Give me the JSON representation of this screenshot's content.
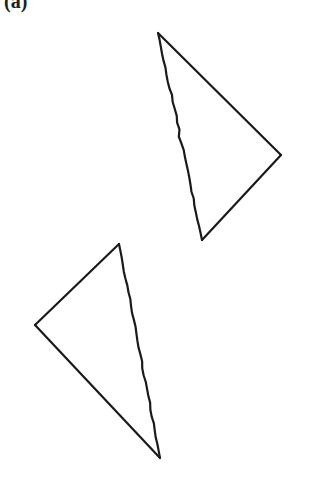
{
  "figure": {
    "panel_label": "(a)",
    "background_color": "#ffffff",
    "stroke_color": "#1a1a1a",
    "stroke_width": 2.2,
    "canvas": {
      "width": 328,
      "height": 486
    },
    "triangles": [
      {
        "name": "triangle-ABC",
        "vertices": [
          {
            "label": "A",
            "x": 119,
            "y": 244
          },
          {
            "label": "B",
            "x": 35,
            "y": 325
          },
          {
            "label": "C",
            "x": 160,
            "y": 458
          }
        ],
        "edges": [
          {
            "from": "B",
            "to": "A",
            "style": "straight"
          },
          {
            "from": "B",
            "to": "C",
            "style": "straight"
          },
          {
            "from": "A",
            "to": "C",
            "style": "wavy"
          }
        ]
      },
      {
        "name": "triangle-A-prime-B-prime-C-prime",
        "vertices": [
          {
            "label": "A′",
            "x": 202,
            "y": 240
          },
          {
            "label": "B′",
            "x": 281,
            "y": 155
          },
          {
            "label": "C′",
            "x": 158,
            "y": 33
          }
        ],
        "edges": [
          {
            "from": "C′",
            "to": "B′",
            "style": "straight"
          },
          {
            "from": "B′",
            "to": "A′",
            "style": "straight"
          },
          {
            "from": "C′",
            "to": "A′",
            "style": "wavy"
          }
        ]
      }
    ],
    "labels": [
      {
        "name": "label-A",
        "base": "A",
        "prime": "",
        "x": 112,
        "y": 212
      },
      {
        "name": "label-B",
        "base": "B",
        "prime": "",
        "x": 8,
        "y": 310
      },
      {
        "name": "label-C",
        "base": "C",
        "prime": "",
        "x": 152,
        "y": 464
      },
      {
        "name": "label-A-prime",
        "base": "A",
        "prime": "′",
        "x": 180,
        "y": 249
      },
      {
        "name": "label-B-prime",
        "base": "B",
        "prime": "′",
        "x": 292,
        "y": 137
      },
      {
        "name": "label-C-prime",
        "base": "C",
        "prime": "′",
        "x": 124,
        "y": 15
      }
    ]
  }
}
